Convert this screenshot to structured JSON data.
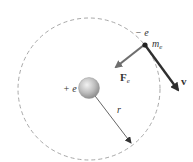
{
  "diagram": {
    "title": "",
    "orbit": {
      "style": "dashed",
      "color": "#a8a8a8"
    },
    "nucleus": {
      "charge_label": "+ e",
      "color": "#bdbdbd"
    },
    "electron": {
      "charge_label": "− e",
      "mass_label_main": "m",
      "mass_label_sub": "e",
      "color": "#222222"
    },
    "force": {
      "label_main": "F",
      "label_sub": "e",
      "color": "#6e6e6e"
    },
    "velocity": {
      "label": "v",
      "color": "#2f2f2f"
    },
    "radius": {
      "label": "r",
      "color": "#555555"
    }
  }
}
